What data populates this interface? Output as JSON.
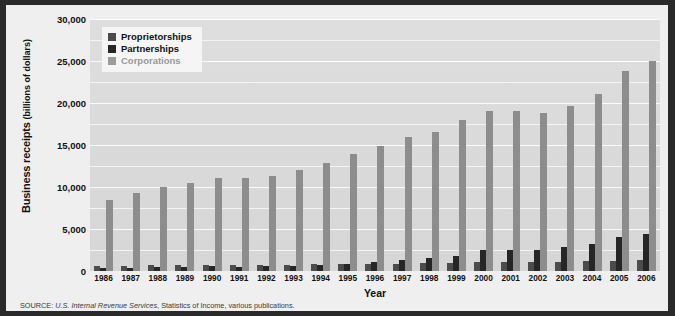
{
  "chart_data": {
    "type": "bar",
    "title": "",
    "xlabel": "Year",
    "ylabel": "Business receipts (billions of dollars)",
    "ylabel_main": "Business receipts",
    "ylabel_units": "(billions of dollars)",
    "ylim": [
      0,
      30000
    ],
    "ytick_labels": [
      "0",
      "5,000",
      "10,000",
      "15,000",
      "20,000",
      "25,000",
      "30,000"
    ],
    "ytick_values": [
      0,
      5000,
      10000,
      15000,
      20000,
      25000,
      30000
    ],
    "grid": true,
    "gridline_step": 2500,
    "legend_position": "top-left",
    "categories": [
      "1986",
      "1987",
      "1988",
      "1989",
      "1990",
      "1991",
      "1992",
      "1993",
      "1994",
      "1995",
      "1996",
      "1997",
      "1998",
      "1999",
      "2000",
      "2001",
      "2002",
      "2003",
      "2004",
      "2005",
      "2006"
    ],
    "series": [
      {
        "name": "Proprietorships",
        "color": "#4c4c4c",
        "values": [
          560,
          610,
          672,
          693,
          731,
          713,
          737,
          757,
          811,
          807,
          843,
          870,
          918,
          969,
          1021,
          1017,
          1030,
          1050,
          1140,
          1222,
          1278
        ]
      },
      {
        "name": "Partnerships",
        "color": "#262626",
        "values": [
          378,
          411,
          464,
          490,
          542,
          531,
          558,
          620,
          741,
          853,
          1043,
          1297,
          1532,
          1827,
          2458,
          2481,
          2453,
          2805,
          3272,
          4010,
          4400
        ]
      },
      {
        "name": "Corporations",
        "color": "#8d8d8d",
        "values": [
          8500,
          9250,
          9950,
          10500,
          11100,
          11100,
          11350,
          12000,
          12900,
          13950,
          14900,
          15900,
          16500,
          18000,
          19000,
          19000,
          18800,
          19700,
          21100,
          23800,
          25000
        ]
      }
    ]
  },
  "legend": {
    "items": [
      {
        "label": "Proprietorships",
        "color": "#4c4c4c",
        "style": "dark"
      },
      {
        "label": "Partnerships",
        "color": "#262626",
        "style": "dark"
      },
      {
        "label": "Corporations",
        "color": "#9c9c9c",
        "style": "muted"
      }
    ]
  },
  "source": {
    "prefix": "SOURCE:",
    "italic_part": "U.S. Internal Revenue Services",
    "rest": ", Statistics of Income, various publications."
  },
  "colors": {
    "frame": "#2a2a2a",
    "page_background": "#efefef",
    "plot_background": "#d9d9d9",
    "gridline": "#f7f7f7",
    "legend_background": "#f5f5f5"
  }
}
